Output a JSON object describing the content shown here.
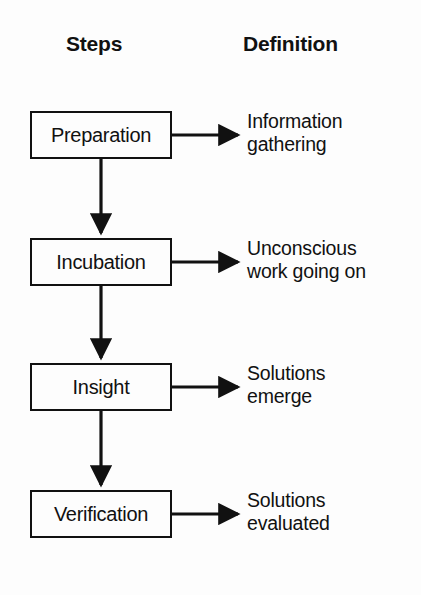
{
  "diagram": {
    "background_color": "#fdfdfd",
    "line_color": "#111111",
    "headers": {
      "steps": "Steps",
      "definition": "Definition"
    },
    "rows": [
      {
        "step": "Preparation",
        "definition_line1": "Information",
        "definition_line2": "gathering"
      },
      {
        "step": "Incubation",
        "definition_line1": "Unconscious",
        "definition_line2": "work going on"
      },
      {
        "step": "Insight",
        "definition_line1": "Solutions",
        "definition_line2": "emerge"
      },
      {
        "step": "Verification",
        "definition_line1": "Solutions",
        "definition_line2": "evaluated"
      }
    ]
  }
}
